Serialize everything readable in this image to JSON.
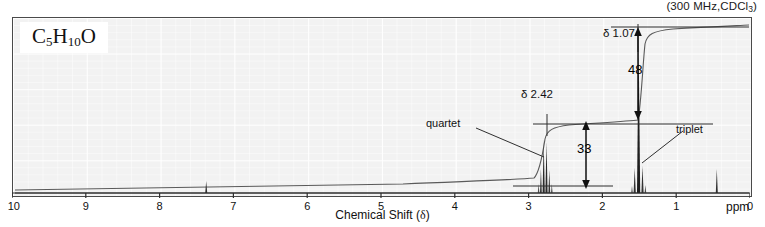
{
  "header": {
    "conditions_prefix": "(300 MHz,CDCl",
    "conditions_sub": "3",
    "conditions_suffix": ")",
    "conditions_full": "(300 MHz,CDCl3)"
  },
  "formula": {
    "e1": "C",
    "s1": "5",
    "e2": "H",
    "s2": "10",
    "e3": "O",
    "full": "C5H10O"
  },
  "annotations": {
    "delta_quartet": "δ 2.42",
    "delta_triplet": "δ 1.07",
    "label_quartet": "quartet",
    "label_triplet": "triplet",
    "integral_quartet": "33",
    "integral_triplet": "48"
  },
  "axis": {
    "title_text": "Chemical Shift (",
    "title_delta": "δ",
    "title_close": ")",
    "unit": "ppm",
    "ticks": [
      "10",
      "9",
      "8",
      "7",
      "6",
      "5",
      "4",
      "3",
      "2",
      "1",
      "0"
    ]
  },
  "colors": {
    "plot_background": "#f2f2f2",
    "frame": "#4a4a4a",
    "trace": "#333333",
    "integral": "#555555",
    "text": "#111111"
  },
  "chart_data": {
    "type": "line",
    "title": "",
    "subtitle": "(300 MHz,CDCl3)",
    "xlabel": "Chemical Shift (δ)",
    "ylabel": "",
    "xunit": "ppm",
    "xlim": [
      10,
      0
    ],
    "x_reversed": true,
    "grid": true,
    "legend": null,
    "ticks": [
      10,
      9,
      8,
      7,
      6,
      5,
      4,
      3,
      2,
      1,
      0
    ],
    "peaks": [
      {
        "shift": 7.27,
        "label": "CHCl3 residual",
        "multiplicity": "singlet",
        "rel_height": 0.07,
        "integral": null
      },
      {
        "shift": 2.42,
        "label": "quartet",
        "multiplicity": "quartet",
        "rel_height": 0.62,
        "integral": 33,
        "lines": [
          2.45,
          2.435,
          2.42,
          2.405
        ]
      },
      {
        "shift": 1.07,
        "label": "triplet",
        "multiplicity": "triplet",
        "rel_height": 1.0,
        "integral": 48,
        "lines": [
          1.09,
          1.07,
          1.05
        ]
      },
      {
        "shift": 0.0,
        "label": "TMS",
        "multiplicity": "singlet",
        "rel_height": 0.12,
        "integral": null
      }
    ],
    "integration_steps": [
      {
        "shift": 2.42,
        "value": 33
      },
      {
        "shift": 1.07,
        "value": 48
      }
    ],
    "series": [
      {
        "name": "1H NMR spectrum",
        "kind": "spectrum"
      },
      {
        "name": "integration trace",
        "kind": "integral"
      }
    ]
  }
}
